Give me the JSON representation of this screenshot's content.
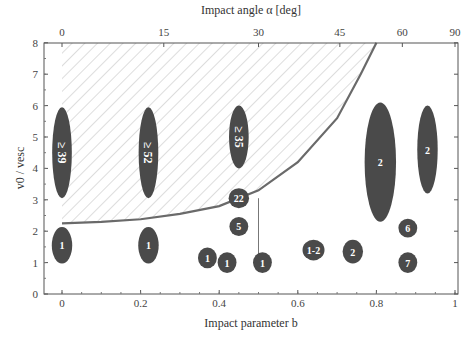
{
  "chart_data": {
    "type": "scatter",
    "title": "",
    "xlabel": "Impact parameter b",
    "ylabel": "v0 / vesc",
    "top_xlabel": "Impact angle α [deg]",
    "xlim": [
      0,
      1
    ],
    "ylim": [
      0,
      8
    ],
    "x_ticks": [
      "0",
      "0.2",
      "0.4",
      "0.6",
      "0.8",
      "1"
    ],
    "y_ticks": [
      "0",
      "1",
      "2",
      "3",
      "4",
      "5",
      "6",
      "7",
      "8"
    ],
    "top_ticks": [
      {
        "label": "0",
        "b": 0.0
      },
      {
        "label": "15",
        "b": 0.259
      },
      {
        "label": "30",
        "b": 0.5
      },
      {
        "label": "45",
        "b": 0.707
      },
      {
        "label": "60",
        "b": 0.866
      },
      {
        "label": "90",
        "b": 1.0
      }
    ],
    "grid": false,
    "colors": {
      "marker": "#4a4a4a",
      "curve": "#6a6a6a",
      "hatch": "#bbbbbb",
      "axis": "#555555"
    },
    "boundary_curve": {
      "description": "Hatched region above curve",
      "points": [
        [
          0,
          2.25
        ],
        [
          0.1,
          2.3
        ],
        [
          0.2,
          2.38
        ],
        [
          0.3,
          2.55
        ],
        [
          0.4,
          2.8
        ],
        [
          0.5,
          3.3
        ],
        [
          0.6,
          4.2
        ],
        [
          0.7,
          5.6
        ],
        [
          0.76,
          7.0
        ],
        [
          0.8,
          8.0
        ]
      ]
    },
    "vertical_line": {
      "b": 0.5,
      "y_from": 1.0,
      "y_to": 3.05
    },
    "points": [
      {
        "b": 0.0,
        "y": 4.5,
        "label": "≥ 39",
        "rx": 0.025,
        "ry": 1.45,
        "rotated": true
      },
      {
        "b": 0.22,
        "y": 4.5,
        "label": "≥ 52",
        "rx": 0.025,
        "ry": 1.45,
        "rotated": true
      },
      {
        "b": 0.45,
        "y": 5.0,
        "label": "≥ 35",
        "rx": 0.025,
        "ry": 1.0,
        "rotated": true
      },
      {
        "b": 0.45,
        "y": 3.05,
        "label": "22",
        "rx": 0.026,
        "ry": 0.32,
        "rotated": false
      },
      {
        "b": 0.45,
        "y": 2.15,
        "label": "5",
        "rx": 0.024,
        "ry": 0.3,
        "rotated": false
      },
      {
        "b": 0.0,
        "y": 1.55,
        "label": "1",
        "rx": 0.026,
        "ry": 0.58,
        "rotated": false
      },
      {
        "b": 0.22,
        "y": 1.55,
        "label": "1",
        "rx": 0.026,
        "ry": 0.58,
        "rotated": false
      },
      {
        "b": 0.37,
        "y": 1.15,
        "label": "1",
        "rx": 0.024,
        "ry": 0.33,
        "rotated": false
      },
      {
        "b": 0.42,
        "y": 1.0,
        "label": "1",
        "rx": 0.024,
        "ry": 0.33,
        "rotated": false
      },
      {
        "b": 0.51,
        "y": 1.0,
        "label": "1",
        "rx": 0.024,
        "ry": 0.33,
        "rotated": false
      },
      {
        "b": 0.64,
        "y": 1.4,
        "label": "1-2",
        "rx": 0.028,
        "ry": 0.33,
        "rotated": false
      },
      {
        "b": 0.74,
        "y": 1.35,
        "label": "2",
        "rx": 0.026,
        "ry": 0.38,
        "rotated": false
      },
      {
        "b": 0.81,
        "y": 4.2,
        "label": "2",
        "rx": 0.04,
        "ry": 1.9,
        "rotated": false
      },
      {
        "b": 0.93,
        "y": 4.6,
        "label": "2",
        "rx": 0.026,
        "ry": 1.4,
        "rotated": false
      },
      {
        "b": 0.88,
        "y": 2.1,
        "label": "6",
        "rx": 0.024,
        "ry": 0.3,
        "rotated": false
      },
      {
        "b": 0.88,
        "y": 1.0,
        "label": "7",
        "rx": 0.024,
        "ry": 0.33,
        "rotated": false
      }
    ]
  }
}
